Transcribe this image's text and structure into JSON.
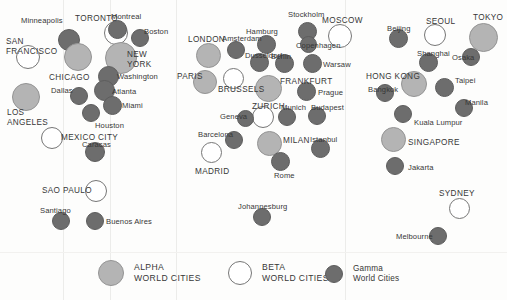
{
  "figure": {
    "background": "#fdfdfc",
    "width": 507,
    "height": 300
  },
  "categories": {
    "alpha": {
      "key": "alpha",
      "color": "#b4b4b4",
      "label_line1": "ALPHA",
      "label_line2": "WORLD CITIES"
    },
    "beta": {
      "key": "beta",
      "color": "#ffffff",
      "label_line1": "BETA",
      "label_line2": "WORLD CITIES"
    },
    "gamma": {
      "key": "gamma",
      "color": "#6d6d6d",
      "label_line1": "Gamma",
      "label_line2": "World Cities"
    }
  },
  "legend": {
    "entries": [
      {
        "name": "legend-alpha",
        "tier": "alpha",
        "line1": "ALPHA",
        "line2": "WORLD CITIES",
        "style": "caps",
        "x": 98,
        "y": 6,
        "d": 26
      },
      {
        "name": "legend-beta",
        "tier": "beta",
        "line1": "BETA",
        "line2": "WORLD CITIES",
        "style": "caps",
        "x": 228,
        "y": 7,
        "d": 24
      },
      {
        "name": "legend-gamma",
        "tier": "gamma",
        "line1": "Gamma",
        "line2": "World Cities",
        "style": "mixed",
        "x": 325,
        "y": 10,
        "d": 18
      }
    ]
  },
  "cities": [
    {
      "name": "Minneapolis",
      "tier": "gamma",
      "cx": 69,
      "cy": 40,
      "d": 22,
      "label": "Minneapolis",
      "lx": 21,
      "ly": 17,
      "size": "minor"
    },
    {
      "name": "TORONTO",
      "tier": "beta",
      "cx": 116,
      "cy": 33,
      "d": 24,
      "label": "TORONTO",
      "lx": 75,
      "ly": 15,
      "size": "major"
    },
    {
      "name": "Montreal",
      "tier": "gamma",
      "cx": 117,
      "cy": 29,
      "d": 19,
      "label": "Montreal",
      "lx": 111,
      "ly": 13,
      "size": "minor"
    },
    {
      "name": "Boston",
      "tier": "gamma",
      "cx": 140,
      "cy": 38,
      "d": 18,
      "label": "Boston",
      "lx": 144,
      "ly": 28,
      "size": "minor"
    },
    {
      "name": "SAN FRANCISCO",
      "tier": "beta",
      "cx": 28,
      "cy": 57,
      "d": 24,
      "label": "SAN\nFRANCISCO",
      "lx": 6,
      "ly": 37,
      "size": "major",
      "two_line": true
    },
    {
      "name": "CHICAGO",
      "tier": "alpha",
      "cx": 78,
      "cy": 57,
      "d": 28,
      "label": "CHICAGO",
      "lx": 49,
      "ly": 74,
      "size": "major"
    },
    {
      "name": "NEW YORK",
      "tier": "alpha",
      "cx": 121,
      "cy": 58,
      "d": 32,
      "label": "NEW\nYORK",
      "lx": 127,
      "ly": 50,
      "size": "major",
      "two_line": true
    },
    {
      "name": "Washington",
      "tier": "gamma",
      "cx": 108,
      "cy": 76,
      "d": 21,
      "label": "Washington",
      "lx": 117,
      "ly": 73,
      "size": "minor"
    },
    {
      "name": "LOS ANGELES",
      "tier": "alpha",
      "cx": 26,
      "cy": 97,
      "d": 28,
      "label": "LOS\nANGELES",
      "lx": 7,
      "ly": 108,
      "size": "major",
      "two_line": true
    },
    {
      "name": "Dallas",
      "tier": "gamma",
      "cx": 79,
      "cy": 96,
      "d": 18,
      "label": "Dallas",
      "lx": 51,
      "ly": 87,
      "size": "minor"
    },
    {
      "name": "Atlanta",
      "tier": "gamma",
      "cx": 104,
      "cy": 90,
      "d": 21,
      "label": "Atlanta",
      "lx": 112,
      "ly": 88,
      "size": "minor"
    },
    {
      "name": "Miami",
      "tier": "gamma",
      "cx": 112,
      "cy": 105,
      "d": 19,
      "label": "Miami",
      "lx": 122,
      "ly": 102,
      "size": "minor"
    },
    {
      "name": "Houston",
      "tier": "gamma",
      "cx": 91,
      "cy": 113,
      "d": 18,
      "label": "Houston",
      "lx": 95,
      "ly": 122,
      "size": "minor"
    },
    {
      "name": "MEXICO CITY",
      "tier": "beta",
      "cx": 52,
      "cy": 138,
      "d": 22,
      "label": "MEXICO CITY",
      "lx": 61,
      "ly": 134,
      "size": "major"
    },
    {
      "name": "Caracas",
      "tier": "gamma",
      "cx": 95,
      "cy": 152,
      "d": 20,
      "label": "Caracas",
      "lx": 82,
      "ly": 141,
      "size": "minor"
    },
    {
      "name": "SAO PAULO",
      "tier": "beta",
      "cx": 96,
      "cy": 191,
      "d": 22,
      "label": "SAO PAULO",
      "lx": 42,
      "ly": 187,
      "size": "major"
    },
    {
      "name": "Santiago",
      "tier": "gamma",
      "cx": 61,
      "cy": 221,
      "d": 18,
      "label": "Santiago",
      "lx": 40,
      "ly": 207,
      "size": "minor"
    },
    {
      "name": "Buenos Aires",
      "tier": "gamma",
      "cx": 95,
      "cy": 221,
      "d": 18,
      "label": "Buenos Aires",
      "lx": 106,
      "ly": 218,
      "size": "minor"
    },
    {
      "name": "LONDON",
      "tier": "alpha",
      "cx": 208,
      "cy": 55,
      "d": 25,
      "label": "LONDON",
      "lx": 188,
      "ly": 36,
      "size": "major"
    },
    {
      "name": "Amsterdam",
      "tier": "gamma",
      "cx": 236,
      "cy": 50,
      "d": 18,
      "label": "Amsterdam",
      "lx": 222,
      "ly": 35,
      "size": "minor"
    },
    {
      "name": "Hamburg",
      "tier": "gamma",
      "cx": 266,
      "cy": 44,
      "d": 19,
      "label": "Hamburg",
      "lx": 246,
      "ly": 28,
      "size": "minor"
    },
    {
      "name": "Stockholm",
      "tier": "gamma",
      "cx": 307,
      "cy": 31,
      "d": 19,
      "label": "Stockholm",
      "lx": 288,
      "ly": 11,
      "size": "minor"
    },
    {
      "name": "MOSCOW",
      "tier": "beta",
      "cx": 340,
      "cy": 36,
      "d": 24,
      "label": "MOSCOW",
      "lx": 322,
      "ly": 17,
      "size": "major"
    },
    {
      "name": "Dusseldorf",
      "tier": "gamma",
      "cx": 259,
      "cy": 62,
      "d": 19,
      "label": "Dusseldorf",
      "lx": 245,
      "ly": 52,
      "size": "minor"
    },
    {
      "name": "Berlin",
      "tier": "gamma",
      "cx": 284,
      "cy": 63,
      "d": 19,
      "label": "Berlin",
      "lx": 271,
      "ly": 53,
      "size": "minor"
    },
    {
      "name": "Copenhagen",
      "tier": "gamma",
      "cx": 308,
      "cy": 44,
      "d": 17,
      "label": "Copenhagen",
      "lx": 296,
      "ly": 42,
      "size": "minor"
    },
    {
      "name": "Warsaw",
      "tier": "gamma",
      "cx": 312,
      "cy": 63,
      "d": 19,
      "label": "Warsaw",
      "lx": 323,
      "ly": 61,
      "size": "minor"
    },
    {
      "name": "PARIS",
      "tier": "alpha",
      "cx": 205,
      "cy": 82,
      "d": 24,
      "label": "PARIS",
      "lx": 177,
      "ly": 73,
      "size": "major"
    },
    {
      "name": "BRUSSELS",
      "tier": "beta",
      "cx": 233,
      "cy": 78,
      "d": 21,
      "label": "BRUSSELS",
      "lx": 218,
      "ly": 86,
      "size": "major"
    },
    {
      "name": "FRANKFURT",
      "tier": "alpha",
      "cx": 268,
      "cy": 88,
      "d": 27,
      "label": "FRANKFURT",
      "lx": 280,
      "ly": 78,
      "size": "major"
    },
    {
      "name": "Prague",
      "tier": "gamma",
      "cx": 306,
      "cy": 91,
      "d": 19,
      "label": "Prague",
      "lx": 318,
      "ly": 89,
      "size": "minor"
    },
    {
      "name": "ZURICH",
      "tier": "beta",
      "cx": 263,
      "cy": 117,
      "d": 22,
      "label": "ZURICH",
      "lx": 252,
      "ly": 103,
      "size": "major"
    },
    {
      "name": "Munich",
      "tier": "gamma",
      "cx": 287,
      "cy": 117,
      "d": 18,
      "label": "Munich",
      "lx": 281,
      "ly": 104,
      "size": "minor"
    },
    {
      "name": "Budapest",
      "tier": "gamma",
      "cx": 317,
      "cy": 116,
      "d": 18,
      "label": "Budapest",
      "lx": 311,
      "ly": 104,
      "size": "minor"
    },
    {
      "name": "Geneva",
      "tier": "gamma",
      "cx": 245,
      "cy": 118,
      "d": 17,
      "label": "Geneva",
      "lx": 220,
      "ly": 113,
      "size": "minor"
    },
    {
      "name": "Barcelona",
      "tier": "gamma",
      "cx": 234,
      "cy": 140,
      "d": 18,
      "label": "Barcelona",
      "lx": 198,
      "ly": 131,
      "size": "minor"
    },
    {
      "name": "MILAN",
      "tier": "alpha",
      "cx": 269,
      "cy": 143,
      "d": 25,
      "label": "MILAN",
      "lx": 283,
      "ly": 137,
      "size": "major"
    },
    {
      "name": "Istanbul",
      "tier": "gamma",
      "cx": 320,
      "cy": 148,
      "d": 19,
      "label": "Istanbul",
      "lx": 310,
      "ly": 136,
      "size": "minor"
    },
    {
      "name": "MADRID",
      "tier": "beta",
      "cx": 211,
      "cy": 152,
      "d": 21,
      "label": "MADRID",
      "lx": 195,
      "ly": 168,
      "size": "major"
    },
    {
      "name": "Rome",
      "tier": "gamma",
      "cx": 280,
      "cy": 161,
      "d": 19,
      "label": "Rome",
      "lx": 274,
      "ly": 172,
      "size": "minor"
    },
    {
      "name": "Johannesburg",
      "tier": "gamma",
      "cx": 262,
      "cy": 217,
      "d": 18,
      "label": "Johannesburg",
      "lx": 238,
      "ly": 203,
      "size": "minor"
    },
    {
      "name": "Beijing",
      "tier": "gamma",
      "cx": 398,
      "cy": 38,
      "d": 19,
      "label": "Beijing",
      "lx": 387,
      "ly": 25,
      "size": "minor"
    },
    {
      "name": "SEOUL",
      "tier": "beta",
      "cx": 435,
      "cy": 35,
      "d": 22,
      "label": "SEOUL",
      "lx": 426,
      "ly": 18,
      "size": "major"
    },
    {
      "name": "TOKYO",
      "tier": "alpha",
      "cx": 483,
      "cy": 37,
      "d": 29,
      "label": "TOKYO",
      "lx": 473,
      "ly": 14,
      "size": "major"
    },
    {
      "name": "Shanghai",
      "tier": "gamma",
      "cx": 428,
      "cy": 62,
      "d": 19,
      "label": "Shanghai",
      "lx": 417,
      "ly": 50,
      "size": "minor"
    },
    {
      "name": "Osaka",
      "tier": "gamma",
      "cx": 471,
      "cy": 57,
      "d": 18,
      "label": "Osaka",
      "lx": 452,
      "ly": 54,
      "size": "minor"
    },
    {
      "name": "HONG KONG",
      "tier": "alpha",
      "cx": 414,
      "cy": 84,
      "d": 26,
      "label": "HONG KONG",
      "lx": 366,
      "ly": 73,
      "size": "major"
    },
    {
      "name": "Taipei",
      "tier": "gamma",
      "cx": 444,
      "cy": 87,
      "d": 19,
      "label": "Taipei",
      "lx": 455,
      "ly": 77,
      "size": "minor"
    },
    {
      "name": "Bangkok",
      "tier": "gamma",
      "cx": 385,
      "cy": 93,
      "d": 18,
      "label": "Bangkok",
      "lx": 368,
      "ly": 86,
      "size": "minor"
    },
    {
      "name": "Manila",
      "tier": "gamma",
      "cx": 464,
      "cy": 108,
      "d": 18,
      "label": "Manila",
      "lx": 465,
      "ly": 99,
      "size": "minor"
    },
    {
      "name": "Kuala Lumpur",
      "tier": "gamma",
      "cx": 403,
      "cy": 114,
      "d": 18,
      "label": "Kuala Lumpur",
      "lx": 414,
      "ly": 119,
      "size": "minor"
    },
    {
      "name": "SINGAPORE",
      "tier": "alpha",
      "cx": 393,
      "cy": 139,
      "d": 25,
      "label": "SINGAPORE",
      "lx": 408,
      "ly": 139,
      "size": "major"
    },
    {
      "name": "Jakarta",
      "tier": "gamma",
      "cx": 395,
      "cy": 166,
      "d": 18,
      "label": "Jakarta",
      "lx": 408,
      "ly": 164,
      "size": "minor"
    },
    {
      "name": "SYDNEY",
      "tier": "beta",
      "cx": 459,
      "cy": 208,
      "d": 21,
      "label": "SYDNEY",
      "lx": 439,
      "ly": 190,
      "size": "major"
    },
    {
      "name": "Melbourne",
      "tier": "gamma",
      "cx": 438,
      "cy": 236,
      "d": 18,
      "label": "Melbourne",
      "lx": 396,
      "ly": 233,
      "size": "minor"
    }
  ]
}
